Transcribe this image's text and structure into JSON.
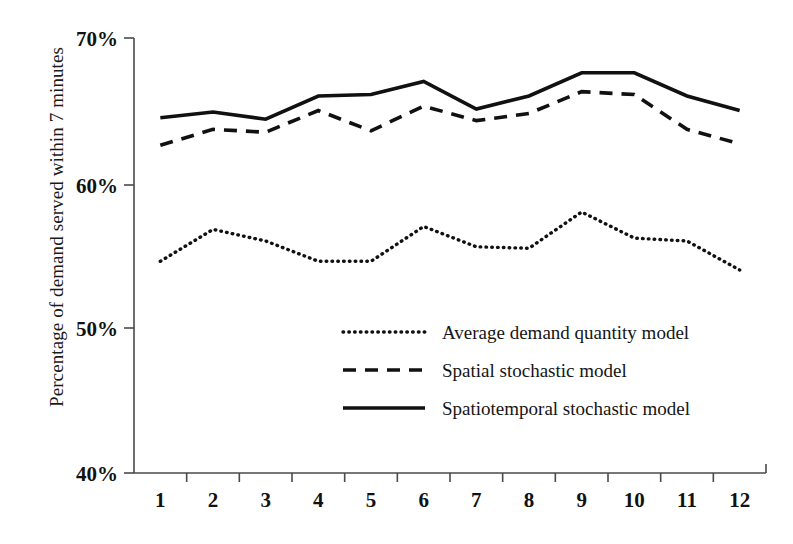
{
  "chart_data": {
    "type": "line",
    "title": "",
    "xlabel": "",
    "ylabel": "Percentage of demand served within 7 minutes",
    "categories": [
      "1",
      "2",
      "3",
      "4",
      "5",
      "6",
      "7",
      "8",
      "9",
      "10",
      "11",
      "12"
    ],
    "ylim": [
      40,
      70
    ],
    "ytick_labels": [
      "70%",
      "60%",
      "50%",
      "40%"
    ],
    "ytick_values": [
      70,
      60,
      50,
      40
    ],
    "grid": false,
    "legend_position": "center",
    "series": [
      {
        "name": "Average demand quantity model",
        "style": "dotted",
        "values": [
          54.6,
          56.8,
          56.0,
          54.6,
          54.6,
          57.0,
          55.6,
          55.5,
          58.0,
          56.2,
          56.0,
          54.0
        ]
      },
      {
        "name": "Spatial stochastic model",
        "style": "dashed",
        "values": [
          62.6,
          63.7,
          63.5,
          65.0,
          63.6,
          65.3,
          64.3,
          64.8,
          66.3,
          66.1,
          63.7,
          62.7
        ]
      },
      {
        "name": "Spatiotemporal stochastic model",
        "style": "solid",
        "values": [
          64.5,
          64.9,
          64.4,
          66.0,
          66.1,
          67.0,
          65.1,
          66.0,
          67.6,
          67.6,
          66.0,
          65.0
        ]
      }
    ]
  },
  "axis": {
    "y_labels": [
      "70%",
      "60%",
      "50%",
      "40%"
    ],
    "x_labels": [
      "1",
      "2",
      "3",
      "4",
      "5",
      "6",
      "7",
      "8",
      "9",
      "10",
      "11",
      "12"
    ]
  },
  "legend": {
    "entries": [
      {
        "label": "Average demand quantity model",
        "style": "dotted"
      },
      {
        "label": "Spatial stochastic model",
        "style": "dashed"
      },
      {
        "label": "Spatiotemporal stochastic model",
        "style": "solid"
      }
    ]
  },
  "colors": {
    "ink": "#111111",
    "axis": "#4a4a4a",
    "background": "#ffffff"
  }
}
